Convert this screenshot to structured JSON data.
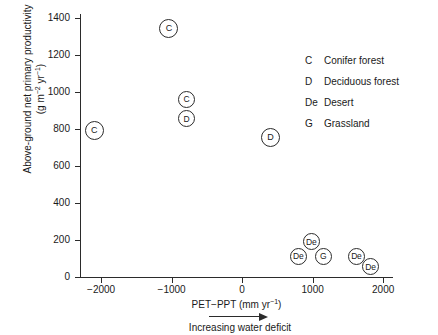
{
  "chart_data": {
    "type": "scatter",
    "title": "",
    "xlabel": "PET−PPT (mm yr⁻¹)",
    "ylabel": "Above-ground net primary productivity (g m⁻² yr⁻¹)",
    "ylabel_line1": "Above-ground net primary productivity",
    "ylabel_line2": "(g m",
    "ylabel_line2b": " yr",
    "xlabel_main": "PET−PPT (mm yr",
    "xlabel_tail": ")",
    "xlabel_unit_prefix": "PET−PPT (mm yr",
    "xlim": [
      -2400,
      2400
    ],
    "ylim": [
      0,
      1450
    ],
    "xticks": [
      -2000,
      -1000,
      0,
      1000,
      2000
    ],
    "xtick_labels": [
      "−2000",
      "−1000",
      "0",
      "1000",
      "2000"
    ],
    "yticks": [
      0,
      200,
      400,
      600,
      800,
      1000,
      1200,
      1400
    ],
    "ytick_labels": [
      "0",
      "200",
      "400",
      "600",
      "800",
      "1000",
      "1200",
      "1400"
    ],
    "grid": false,
    "legend_position": "upper-right",
    "annotation": "Increasing water deficit",
    "points": [
      {
        "label": "C",
        "x": -2100,
        "y": 790,
        "size": "big"
      },
      {
        "label": "C",
        "x": -1040,
        "y": 1345,
        "size": "big"
      },
      {
        "label": "C",
        "x": -790,
        "y": 960,
        "size": "small"
      },
      {
        "label": "D",
        "x": -790,
        "y": 855,
        "size": "small"
      },
      {
        "label": "D",
        "x": 400,
        "y": 755,
        "size": "big"
      },
      {
        "label": "De",
        "x": 980,
        "y": 190,
        "size": "small"
      },
      {
        "label": "De",
        "x": 795,
        "y": 110,
        "size": "small"
      },
      {
        "label": "G",
        "x": 1150,
        "y": 110,
        "size": "small"
      },
      {
        "label": "De",
        "x": 1620,
        "y": 110,
        "size": "small"
      },
      {
        "label": "De",
        "x": 1820,
        "y": 55,
        "size": "small"
      }
    ],
    "legend": [
      {
        "key": "C",
        "label": "Conifer forest"
      },
      {
        "key": "D",
        "label": "Deciduous forest"
      },
      {
        "key": "De",
        "label": "Desert"
      },
      {
        "key": "G",
        "label": "Grassland"
      }
    ]
  }
}
